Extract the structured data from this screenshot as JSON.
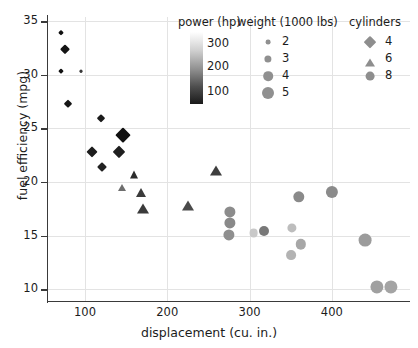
{
  "chart_data": {
    "type": "scatter",
    "title": "",
    "xlabel": "displacement (cu. in.)",
    "ylabel": "fuel efficiency (mpg)",
    "xlim": [
      55,
      495
    ],
    "ylim": [
      8.9,
      35.4
    ],
    "xticks": [
      100,
      200,
      300,
      400
    ],
    "yticks": [
      10,
      15,
      20,
      25,
      30,
      35
    ],
    "grid": true,
    "encodings": {
      "x": "displacement (cu. in.)",
      "y": "fuel efficiency (mpg)",
      "color": "power (hp)",
      "size": "weight (1000 lbs)",
      "shape": "cylinders"
    },
    "legends": {
      "color": {
        "title": "power (hp)",
        "type": "colorbar",
        "ticks": [
          300,
          200,
          100
        ],
        "high_color": "#ffffff",
        "low_color": "#1a1a1a",
        "note": "light = high hp, dark = low hp"
      },
      "size": {
        "title": "weight (1000 lbs)",
        "entries": [
          {
            "label": "2",
            "radius": 2.4
          },
          {
            "label": "3",
            "radius": 3.6
          },
          {
            "label": "4",
            "radius": 4.8
          },
          {
            "label": "5",
            "radius": 6.0
          }
        ]
      },
      "shape": {
        "title": "cylinders",
        "entries": [
          {
            "label": "4",
            "shape": "diamond"
          },
          {
            "label": "6",
            "shape": "triangle"
          },
          {
            "label": "8",
            "shape": "circle"
          }
        ]
      }
    },
    "points": [
      {
        "x": 71,
        "y": 33.9,
        "shape": "diamond",
        "size": 2.2,
        "color": "#101010",
        "hp": 65,
        "weight": 1.8
      },
      {
        "x": 76,
        "y": 32.4,
        "shape": "diamond",
        "size": 3.3,
        "color": "#141414",
        "hp": 75,
        "weight": 2.2
      },
      {
        "x": 71,
        "y": 30.4,
        "shape": "diamond",
        "size": 1.9,
        "color": "#121212",
        "hp": 52,
        "weight": 1.6
      },
      {
        "x": 95,
        "y": 30.4,
        "shape": "diamond",
        "size": 1.3,
        "color": "#3a3a3a",
        "hp": 113,
        "weight": 1.5
      },
      {
        "x": 79,
        "y": 27.3,
        "shape": "diamond",
        "size": 3.2,
        "color": "#161616",
        "hp": 70,
        "weight": 2.1
      },
      {
        "x": 120,
        "y": 26.0,
        "shape": "diamond",
        "size": 2.8,
        "color": "#1b1b1b",
        "hp": 91,
        "weight": 2.0
      },
      {
        "x": 146,
        "y": 24.4,
        "shape": "diamond",
        "size": 5.4,
        "color": "#101010",
        "hp": 85,
        "weight": 3.0
      },
      {
        "x": 108,
        "y": 22.8,
        "shape": "diamond",
        "size": 4.1,
        "color": "#1d1d1d",
        "hp": 93,
        "weight": 2.4
      },
      {
        "x": 141,
        "y": 22.8,
        "shape": "diamond",
        "size": 4.6,
        "color": "#1f1f1f",
        "hp": 95,
        "weight": 2.7
      },
      {
        "x": 121,
        "y": 21.4,
        "shape": "diamond",
        "size": 3.5,
        "color": "#212121",
        "hp": 98,
        "weight": 2.3
      },
      {
        "x": 160,
        "y": 21.0,
        "shape": "triangle",
        "size": 4.3,
        "color": "#2b2b2b",
        "hp": 110,
        "weight": 2.7
      },
      {
        "x": 145,
        "y": 19.8,
        "shape": "triangle",
        "size": 4.2,
        "color": "#6e6e6e",
        "hp": 155,
        "weight": 2.6
      },
      {
        "x": 168,
        "y": 19.3,
        "shape": "triangle",
        "size": 4.9,
        "color": "#3b3b3b",
        "hp": 120,
        "weight": 2.9
      },
      {
        "x": 170,
        "y": 17.8,
        "shape": "triangle",
        "size": 5.3,
        "color": "#3a3a3a",
        "hp": 122,
        "weight": 3.1
      },
      {
        "x": 259,
        "y": 21.4,
        "shape": "triangle",
        "size": 5.4,
        "color": "#3e3e3e",
        "hp": 125,
        "weight": 3.2
      },
      {
        "x": 225,
        "y": 18.1,
        "shape": "triangle",
        "size": 5.3,
        "color": "#4a4a4a",
        "hp": 132,
        "weight": 3.2
      },
      {
        "x": 276,
        "y": 17.2,
        "shape": "circle",
        "size": 5.6,
        "color": "#8c8c8c",
        "hp": 180,
        "weight": 3.6
      },
      {
        "x": 276,
        "y": 16.2,
        "shape": "circle",
        "size": 5.6,
        "color": "#898989",
        "hp": 180,
        "weight": 3.6
      },
      {
        "x": 275,
        "y": 15.1,
        "shape": "circle",
        "size": 5.6,
        "color": "#8f8f8f",
        "hp": 185,
        "weight": 3.6
      },
      {
        "x": 305,
        "y": 15.2,
        "shape": "circle",
        "size": 4.4,
        "color": "#c9c9c9",
        "hp": 230,
        "weight": 3.0
      },
      {
        "x": 318,
        "y": 15.4,
        "shape": "circle",
        "size": 5.0,
        "color": "#787878",
        "hp": 165,
        "weight": 3.4
      },
      {
        "x": 360,
        "y": 18.6,
        "shape": "circle",
        "size": 5.7,
        "color": "#8a8a8a",
        "hp": 175,
        "weight": 3.8
      },
      {
        "x": 351,
        "y": 15.7,
        "shape": "circle",
        "size": 4.6,
        "color": "#bdbdbd",
        "hp": 215,
        "weight": 3.2
      },
      {
        "x": 362,
        "y": 14.2,
        "shape": "circle",
        "size": 5.2,
        "color": "#a7a7a7",
        "hp": 200,
        "weight": 3.5
      },
      {
        "x": 350,
        "y": 13.2,
        "shape": "circle",
        "size": 4.9,
        "color": "#b3b3b3",
        "hp": 205,
        "weight": 3.4
      },
      {
        "x": 400,
        "y": 19.1,
        "shape": "circle",
        "size": 6.1,
        "color": "#8b8b8b",
        "hp": 175,
        "weight": 4.2
      },
      {
        "x": 440,
        "y": 14.6,
        "shape": "circle",
        "size": 6.4,
        "color": "#9c9c9c",
        "hp": 190,
        "weight": 4.4
      },
      {
        "x": 455,
        "y": 10.2,
        "shape": "circle",
        "size": 6.6,
        "color": "#a0a0a0",
        "hp": 200,
        "weight": 4.9
      },
      {
        "x": 472,
        "y": 10.2,
        "shape": "circle",
        "size": 6.6,
        "color": "#a4a4a4",
        "hp": 208,
        "weight": 5.0
      }
    ]
  }
}
